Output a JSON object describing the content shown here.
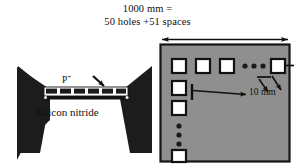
{
  "figure": {
    "name": "micromachined-perforated-beam-figure",
    "background_color": "#ffffff",
    "ink_color": "#101010",
    "panel_fill_color": "#8f8f8f",
    "hole_fill_color": "#ffffff",
    "structure_color": "#1a1a1a"
  },
  "annotations": {
    "dimension_top_line1": "1000 mm =",
    "dimension_top_line2": "50 holes +51 spaces",
    "hole_pitch": "10 mm",
    "doping_label": "P",
    "doping_superscript": "+",
    "material_label": "Silicon nitride"
  },
  "left_panel": {
    "name": "beam-schematic",
    "description": "Suspended perforated beam with two triangular anchors",
    "anchor_count": 2,
    "beam_segment_count": 6,
    "pointer_arrow": "arrow-to-beam-perforation"
  },
  "right_panel": {
    "name": "hole-array-layout",
    "top_row_squares": 4,
    "top_row_dots": 3,
    "left_column_squares": 4,
    "left_column_dots": 3,
    "leader_arrows": 2,
    "span_arrow": "double-headed-width-arrow"
  }
}
